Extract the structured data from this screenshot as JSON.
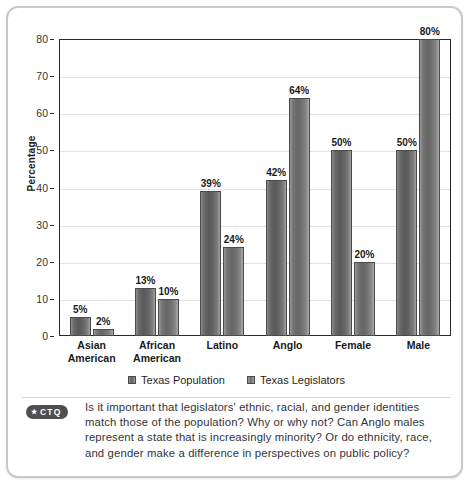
{
  "chart_data": {
    "type": "bar",
    "title": "",
    "xlabel": "",
    "ylabel": "Percentage",
    "ylim": [
      0,
      80
    ],
    "ytick_step": 10,
    "yticks": [
      "0",
      "10",
      "20",
      "30",
      "40",
      "50",
      "60",
      "70",
      "80"
    ],
    "grid": true,
    "legend_position": "bottom",
    "categories": [
      "Asian American",
      "African American",
      "Latino",
      "Anglo",
      "Female",
      "Male"
    ],
    "category_lines": [
      [
        "Asian",
        "American"
      ],
      [
        "African",
        "American"
      ],
      [
        "Latino",
        ""
      ],
      [
        "Anglo",
        ""
      ],
      [
        "Female",
        ""
      ],
      [
        "Male",
        ""
      ]
    ],
    "series": [
      {
        "name": "Texas Population",
        "color": "#5e5e5e",
        "values": [
          5,
          13,
          39,
          42,
          50,
          50
        ],
        "labels": [
          "5%",
          "13%",
          "39%",
          "42%",
          "50%",
          "50%"
        ]
      },
      {
        "name": "Texas Legislators",
        "color": "#6d6d6d",
        "values": [
          2,
          10,
          24,
          64,
          20,
          80
        ],
        "labels": [
          "2%",
          "10%",
          "24%",
          "64%",
          "20%",
          "80%"
        ]
      }
    ]
  },
  "legend": {
    "items": [
      {
        "label": "Texas Population"
      },
      {
        "label": "Texas Legislators"
      }
    ]
  },
  "caption": {
    "badge_star": "★",
    "badge_label": "CTQ",
    "text": "Is it important that legislators' ethnic, racial, and gender identities match those of the population? Why or why not? Can Anglo males represent a state that is increasingly minority? Or do ethnicity, race, and gender make a difference in perspectives on public policy?"
  },
  "colors": {
    "frame_border": "#c9c9c9",
    "axis": "#2a2a2a",
    "gridline": "#e2e2e2",
    "badge_bg": "#4f4f4f",
    "text": "#33333a"
  }
}
